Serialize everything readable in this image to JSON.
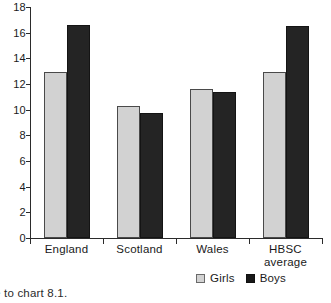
{
  "chart_data": {
    "type": "bar",
    "title": "",
    "xlabel": "",
    "ylabel": "",
    "ylim": [
      0,
      18
    ],
    "yticks": [
      0,
      2,
      4,
      6,
      8,
      10,
      12,
      14,
      16,
      18
    ],
    "grid": false,
    "legend_position": "bottom",
    "categories": [
      "England",
      "Scotland",
      "Wales",
      "HBSC average"
    ],
    "series": [
      {
        "name": "Girls",
        "color": "#d2d2d2",
        "values": [
          12.9,
          10.3,
          11.6,
          12.9
        ]
      },
      {
        "name": "Boys",
        "color": "#242424",
        "values": [
          16.6,
          9.75,
          11.4,
          16.5
        ]
      }
    ]
  },
  "axis": {
    "tick_labels": [
      "18",
      "16",
      "14",
      "12",
      "10",
      "8",
      "6",
      "4",
      "2",
      "0"
    ]
  },
  "x_labels": [
    {
      "line1": "England",
      "line2": ""
    },
    {
      "line1": "Scotland",
      "line2": ""
    },
    {
      "line1": "Wales",
      "line2": ""
    },
    {
      "line1": "HBSC",
      "line2": "average"
    }
  ],
  "legend": {
    "items": [
      {
        "label": "Girls",
        "swatch": "girls-swatch"
      },
      {
        "label": "Boys",
        "swatch": "boys-swatch"
      }
    ]
  },
  "caption": {
    "text": "e to chart 8.1."
  }
}
